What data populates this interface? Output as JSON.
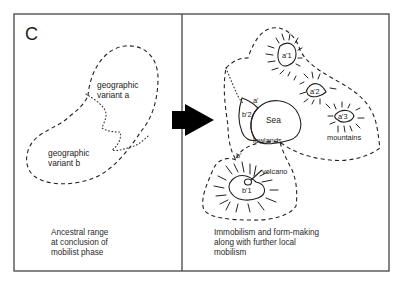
{
  "figure": {
    "panel_letter": "C",
    "left_panel": {
      "variant_a": [
        "geographic",
        "variant a"
      ],
      "variant_b": [
        "geographic",
        "variant b"
      ],
      "caption": [
        "Ancestral range",
        "at conclusion of",
        "mobilist phase"
      ]
    },
    "right_panel": {
      "labels": {
        "a_prime": "a'",
        "b_prime": "b'",
        "a1": "a'1",
        "a2": "a'2",
        "a3": "a'3",
        "b1": "b'1",
        "b2": "b'2",
        "sea": "Sea",
        "lowlands": "lowlands",
        "mountains": "mountains",
        "volcano": "volcano"
      },
      "caption": [
        "Immobilism and form-making",
        "along with further local",
        "mobilism"
      ]
    },
    "arrow": "transition-arrow"
  }
}
